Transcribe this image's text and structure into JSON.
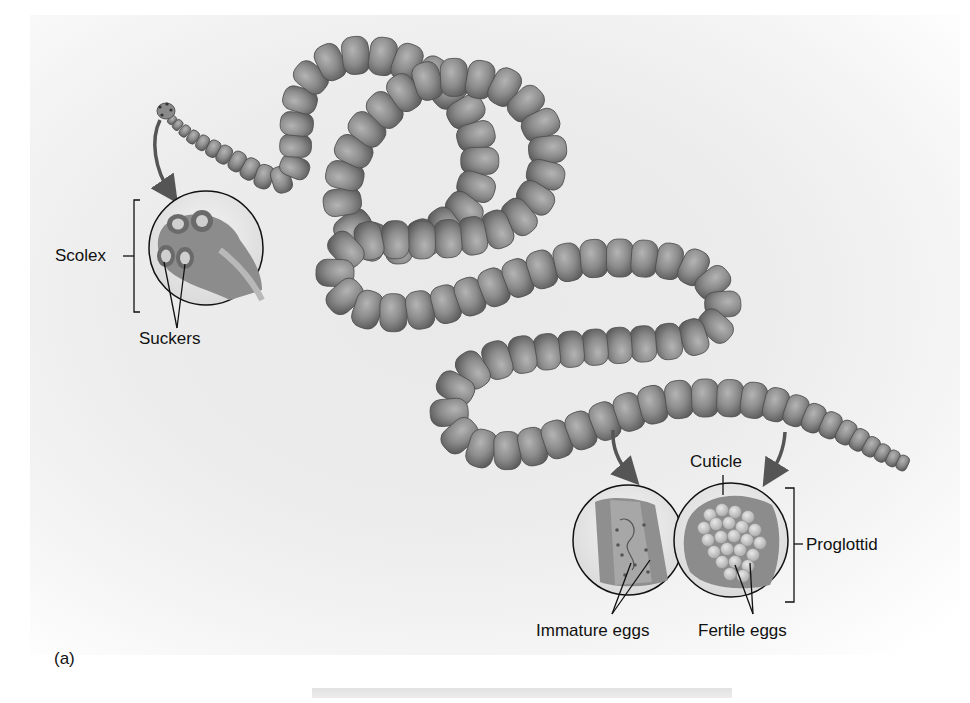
{
  "figure": {
    "panel_label": "(a)",
    "colors": {
      "background": "#ececec",
      "segment_fill": "#8a8a8a",
      "segment_light": "#b0b0b0",
      "segment_dark": "#5a5a5a",
      "line": "#111111"
    }
  },
  "labels": {
    "scolex": "Scolex",
    "suckers": "Suckers",
    "cuticle": "Cuticle",
    "proglottid": "Proglottid",
    "immature_eggs": "Immature eggs",
    "fertile_eggs": "Fertile eggs"
  },
  "insets": [
    {
      "name": "scolex-detail",
      "cx": 206,
      "cy": 248,
      "r": 57
    },
    {
      "name": "immature-proglottid-detail",
      "cx": 628,
      "cy": 540,
      "r": 55
    },
    {
      "name": "fertile-proglottid-detail",
      "cx": 731,
      "cy": 540,
      "r": 57
    }
  ]
}
